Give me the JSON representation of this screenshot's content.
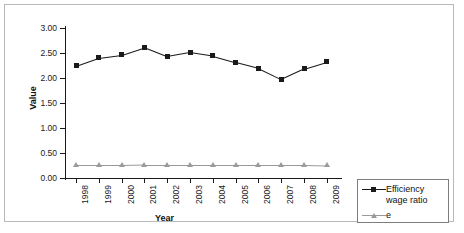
{
  "chart_data": {
    "type": "line",
    "title": "",
    "xlabel": "Year",
    "ylabel": "Value",
    "categories": [
      "1998",
      "1999",
      "2000",
      "2001",
      "2002",
      "2003",
      "2004",
      "2005",
      "2006",
      "2007",
      "2008",
      "2009"
    ],
    "ylim": [
      0.0,
      3.0
    ],
    "yticks": [
      "0.00",
      "0.50",
      "1.00",
      "1.50",
      "2.00",
      "2.50",
      "3.00"
    ],
    "ytick_values": [
      0.0,
      0.5,
      1.0,
      1.5,
      2.0,
      2.5,
      3.0
    ],
    "grid": false,
    "legend_position": "right-bottom",
    "series": [
      {
        "name": "Efficiency wage ratio",
        "marker": "square",
        "color": "#1a1a1a",
        "values": [
          2.25,
          2.41,
          2.47,
          2.62,
          2.44,
          2.52,
          2.45,
          2.32,
          2.2,
          1.98,
          2.19,
          2.33
        ]
      },
      {
        "name": "e",
        "marker": "triangle",
        "color": "#9a9a9a",
        "values": [
          0.26,
          0.26,
          0.26,
          0.27,
          0.27,
          0.27,
          0.27,
          0.27,
          0.27,
          0.27,
          0.27,
          0.26
        ]
      }
    ]
  },
  "legend": {
    "entries": [
      {
        "label": "Efficiency wage ratio"
      },
      {
        "label": "e"
      }
    ]
  }
}
